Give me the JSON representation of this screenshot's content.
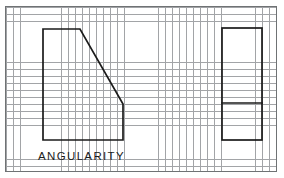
{
  "sheet": {
    "background_color": "#ffffff",
    "grid": {
      "name": "engineering-grid",
      "line_color": "#8e9194",
      "spacing_px": 6.93,
      "frame_border_color": "#6f7274",
      "frame": {
        "x": 5,
        "y": 6,
        "width": 272,
        "height": 166
      }
    }
  },
  "caption": {
    "text": "ANGULARITY"
  },
  "drawing": {
    "line_color": "#1b1b1b",
    "line_width": 1.7,
    "front_view": {
      "label": "angularity-front-view",
      "points": "43,29 80,29 123,104 123,140 43,140 43,29"
    },
    "side_view": {
      "label": "angularity-side-view",
      "rect": {
        "x": 222,
        "y": 28,
        "width": 40,
        "height": 112
      },
      "divider": {
        "x1": 222,
        "y1": 103,
        "x2": 262,
        "y2": 103
      }
    }
  }
}
